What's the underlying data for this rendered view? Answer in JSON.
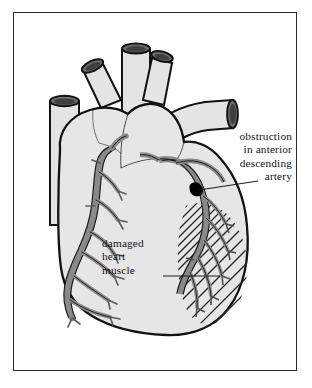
{
  "figure": {
    "kind": "anatomical-illustration",
    "border_color": "#2b2b2b",
    "background_color": "#ffffff"
  },
  "palette": {
    "heart_fill": "#e6e6e6",
    "heart_fill_shadow": "#dcdcdc",
    "vessel_fill": "#e2e2e2",
    "vessel_lumen": "#6f6f6f",
    "vessel_lumen_dark": "#4a4a4a",
    "artery_fill": "#8a8a8a",
    "artery_stroke": "#1c1c1c",
    "outline": "#121212",
    "hatch": "#2a2a2a",
    "obstruction": "#000000",
    "text": "#15161a",
    "leader_line": "#1c1c1c"
  },
  "labels": {
    "obstruction": {
      "name": "obstruction-label",
      "align": "right",
      "lines": [
        "obstruction",
        "in anterior",
        "descending",
        "artery"
      ]
    },
    "damaged": {
      "name": "damaged-muscle-label",
      "align": "left",
      "lines": [
        "damaged",
        "heart",
        "muscle"
      ]
    }
  },
  "annotations": {
    "obstruction_marker": {
      "shape": "filled-blob",
      "meaning": "blockage in the anterior descending coronary artery"
    },
    "damaged_region": {
      "shape": "diagonal-hatching",
      "meaning": "infarcted / damaged heart muscle supplied by the blocked artery"
    }
  },
  "structures": [
    {
      "name": "superior-vena-cava",
      "side": "left"
    },
    {
      "name": "pulmonary-veins",
      "side": "top-left"
    },
    {
      "name": "pulmonary-artery-branches",
      "side": "top"
    },
    {
      "name": "aorta",
      "side": "top-right"
    },
    {
      "name": "left-coronary-artery-tree",
      "side": "left"
    },
    {
      "name": "anterior-descending-artery",
      "side": "right"
    },
    {
      "name": "right-ventricle",
      "side": "center"
    },
    {
      "name": "left-ventricle",
      "side": "right"
    }
  ]
}
